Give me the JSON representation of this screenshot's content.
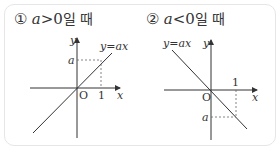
{
  "panels": [
    {
      "marker": "①",
      "var": "a",
      "op": ">",
      "rest": "0",
      "suffix": "일 때",
      "line_label": "y=ax",
      "x_label": "x",
      "y_label": "y",
      "origin_label": "O",
      "one_label": "1",
      "a_label": "a"
    },
    {
      "marker": "②",
      "var": "a",
      "op": "<",
      "rest": "0",
      "suffix": "일 때",
      "line_label": "y=ax",
      "x_label": "x",
      "y_label": "y",
      "origin_label": "O",
      "one_label": "1",
      "a_label": "a"
    }
  ]
}
